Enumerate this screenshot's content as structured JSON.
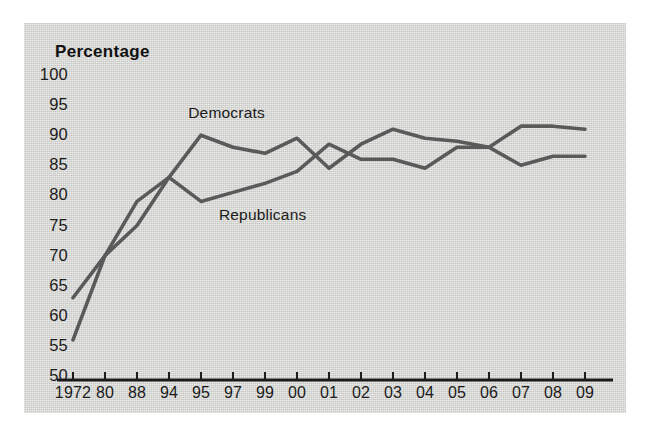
{
  "chart_data": {
    "type": "line",
    "title": "Percentage",
    "xlabel": "",
    "ylabel": "Percentage",
    "ylim": [
      50,
      100
    ],
    "ytick_step": 5,
    "grid": false,
    "legend_position": "inline-annotation",
    "categories": [
      "1972",
      "80",
      "88",
      "94",
      "95",
      "97",
      "99",
      "00",
      "01",
      "02",
      "03",
      "04",
      "05",
      "06",
      "07",
      "08",
      "09"
    ],
    "yticks": [
      "100",
      "95",
      "90",
      "85",
      "80",
      "75",
      "70",
      "65",
      "60",
      "55",
      "50"
    ],
    "series": [
      {
        "name": "Democrats",
        "color": "#5a5a5a",
        "values": [
          63,
          70,
          79,
          83,
          90,
          88,
          87,
          89.5,
          84.5,
          88.5,
          91,
          89.5,
          89,
          88,
          91.5,
          91.5,
          91
        ]
      },
      {
        "name": "Republicans",
        "color": "#5a5a5a",
        "values": [
          56,
          70,
          75,
          83,
          79,
          80.5,
          82,
          84,
          88.5,
          86,
          86,
          84.5,
          88,
          88,
          85,
          86.5,
          86.5
        ]
      }
    ],
    "annotations": [
      {
        "text": "Democrats",
        "x_frac": 0.225,
        "y_value": 93.5
      },
      {
        "text": "Republicans",
        "x_frac": 0.285,
        "y_value": 76.5
      }
    ]
  },
  "figure": {
    "background": "#ffffff",
    "panel_color": "#d5d5d2",
    "line_color": "#5a5a5a",
    "axis_color": "#1b1b1b"
  }
}
